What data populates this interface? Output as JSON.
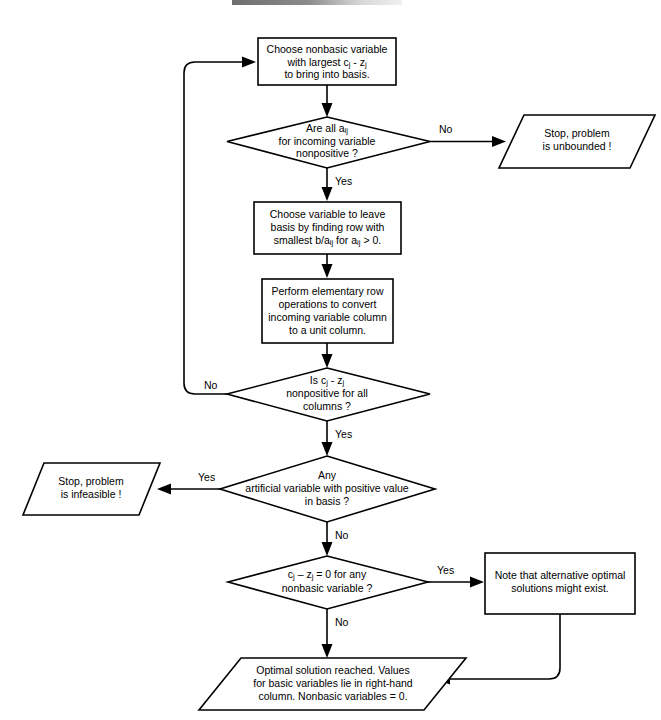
{
  "diagram": {
    "background_color": "#ffffff",
    "line_color": "#000000",
    "shape_fill": "#ffffff"
  },
  "nodes": {
    "choose_entering": {
      "shape": "process",
      "lines": [
        {
          "parts": [
            {
              "t": "Choose nonbasic variable"
            }
          ]
        },
        {
          "parts": [
            {
              "t": "with largest c"
            },
            {
              "t": "j",
              "sub": true
            },
            {
              "t": " - z"
            },
            {
              "t": "j",
              "sub": true
            }
          ]
        },
        {
          "parts": [
            {
              "t": "to bring into basis."
            }
          ]
        }
      ]
    },
    "all_aij_nonpositive": {
      "shape": "decision",
      "lines": [
        {
          "parts": [
            {
              "t": "Are all a"
            },
            {
              "t": "ij",
              "sub": true
            }
          ]
        },
        {
          "parts": [
            {
              "t": "for incoming variable"
            }
          ]
        },
        {
          "parts": [
            {
              "t": "nonpositive ?"
            }
          ]
        }
      ]
    },
    "unbounded": {
      "shape": "io",
      "lines": [
        {
          "parts": [
            {
              "t": "Stop, problem"
            }
          ]
        },
        {
          "parts": [
            {
              "t": "is unbounded !"
            }
          ]
        }
      ]
    },
    "choose_leaving": {
      "shape": "process",
      "lines": [
        {
          "parts": [
            {
              "t": "Choose variable to leave"
            }
          ]
        },
        {
          "parts": [
            {
              "t": "basis by finding row with"
            }
          ]
        },
        {
          "parts": [
            {
              "t": "smallest b/a"
            },
            {
              "t": "ij",
              "sub": true
            },
            {
              "t": " for a"
            },
            {
              "t": "ij",
              "sub": true
            },
            {
              "t": " > 0."
            }
          ]
        }
      ]
    },
    "row_operations": {
      "shape": "process",
      "lines": [
        {
          "parts": [
            {
              "t": "Perform elementary row"
            }
          ]
        },
        {
          "parts": [
            {
              "t": "operations to convert"
            }
          ]
        },
        {
          "parts": [
            {
              "t": "incoming variable column"
            }
          ]
        },
        {
          "parts": [
            {
              "t": "to a unit column."
            }
          ]
        }
      ]
    },
    "cj_zj_nonpositive": {
      "shape": "decision",
      "lines": [
        {
          "parts": [
            {
              "t": "Is c"
            },
            {
              "t": "j",
              "sub": true
            },
            {
              "t": " - z"
            },
            {
              "t": "j",
              "sub": true
            }
          ]
        },
        {
          "parts": [
            {
              "t": "nonpositive for all"
            }
          ]
        },
        {
          "parts": [
            {
              "t": "columns ?"
            }
          ]
        }
      ]
    },
    "artificial_in_basis": {
      "shape": "decision",
      "lines": [
        {
          "parts": [
            {
              "t": "Any"
            }
          ]
        },
        {
          "parts": [
            {
              "t": "artificial variable with positive value"
            }
          ]
        },
        {
          "parts": [
            {
              "t": "in basis ?"
            }
          ]
        }
      ]
    },
    "infeasible": {
      "shape": "io",
      "lines": [
        {
          "parts": [
            {
              "t": "Stop, problem"
            }
          ]
        },
        {
          "parts": [
            {
              "t": "is infeasible !"
            }
          ]
        }
      ]
    },
    "cj_zj_zero": {
      "shape": "decision",
      "lines": [
        {
          "parts": [
            {
              "t": "c"
            },
            {
              "t": "j",
              "sub": true
            },
            {
              "t": " – z"
            },
            {
              "t": "j",
              "sub": true
            },
            {
              "t": " = 0 for any"
            }
          ]
        },
        {
          "parts": [
            {
              "t": "nonbasic variable ?"
            }
          ]
        }
      ]
    },
    "alternative_optima": {
      "shape": "process",
      "lines": [
        {
          "parts": [
            {
              "t": "Note that alternative optimal"
            }
          ]
        },
        {
          "parts": [
            {
              "t": "solutions might exist."
            }
          ]
        }
      ]
    },
    "optimal_solution": {
      "shape": "io",
      "lines": [
        {
          "parts": [
            {
              "t": "Optimal solution reached.  Values"
            }
          ]
        },
        {
          "parts": [
            {
              "t": "for basic variables lie in right-hand"
            }
          ]
        },
        {
          "parts": [
            {
              "t": "column.  Nonbasic variables = 0."
            }
          ]
        }
      ]
    }
  },
  "branch_labels": {
    "unbounded_no": "No",
    "unbounded_yes": "Yes",
    "cjzj_no": "No",
    "cjzj_yes": "Yes",
    "artificial_yes": "Yes",
    "artificial_no": "No",
    "zero_yes": "Yes",
    "zero_no": "No"
  }
}
